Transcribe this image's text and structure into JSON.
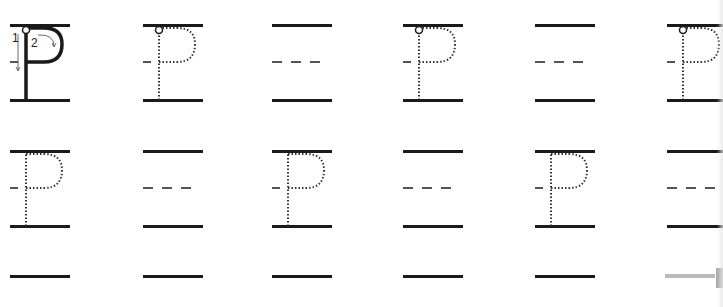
{
  "worksheet": {
    "letter": "P",
    "stroke_labels": {
      "first": "1",
      "second": "2"
    },
    "colors": {
      "ink": "#1a1a1a",
      "dotted": "#333333",
      "midline": "#555555",
      "edge": "#bbbbbb"
    },
    "rows": [
      {
        "top_y": 24,
        "cells": [
          {
            "x": 10,
            "type": "model"
          },
          {
            "x": 143,
            "type": "trace"
          },
          {
            "x": 272,
            "type": "blank"
          },
          {
            "x": 403,
            "type": "trace"
          },
          {
            "x": 535,
            "type": "blank"
          },
          {
            "x": 667,
            "type": "trace"
          }
        ]
      },
      {
        "top_y": 150,
        "cells": [
          {
            "x": 10,
            "type": "trace-nodot"
          },
          {
            "x": 143,
            "type": "blank"
          },
          {
            "x": 272,
            "type": "trace-nodot"
          },
          {
            "x": 403,
            "type": "blank"
          },
          {
            "x": 535,
            "type": "trace-nodot"
          },
          {
            "x": 667,
            "type": "blank"
          }
        ]
      },
      {
        "top_y": 275,
        "cells": [
          {
            "x": 10,
            "type": "line-only"
          },
          {
            "x": 143,
            "type": "line-only"
          },
          {
            "x": 272,
            "type": "line-only"
          },
          {
            "x": 403,
            "type": "line-only"
          },
          {
            "x": 535,
            "type": "line-only"
          },
          {
            "x": 667,
            "type": "line-only-gray"
          }
        ]
      }
    ]
  }
}
